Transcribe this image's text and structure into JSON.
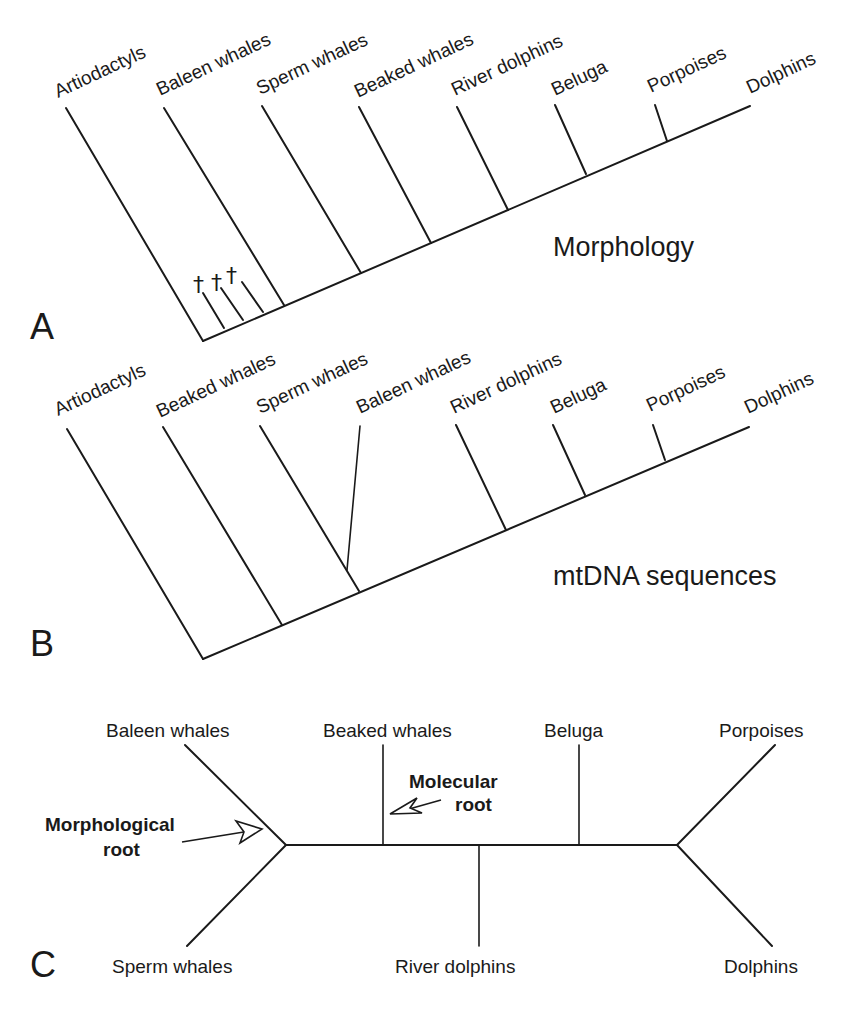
{
  "figure": {
    "panel_a": {
      "letter": "A",
      "title": "Morphology",
      "taxa": [
        "Artiodactyls",
        "Baleen whales",
        "Sperm whales",
        "Beaked whales",
        "River dolphins",
        "Beluga",
        "Porpoises",
        "Dolphins"
      ],
      "fossil_marks": [
        "†",
        "†",
        "†"
      ]
    },
    "panel_b": {
      "letter": "B",
      "title": "mtDNA sequences",
      "taxa": [
        "Artiodactyls",
        "Beaked whales",
        "Sperm whales",
        "Baleen whales",
        "River dolphins",
        "Beluga",
        "Porpoises",
        "Dolphins"
      ]
    },
    "panel_c": {
      "letter": "C",
      "taxa": {
        "baleen": "Baleen whales",
        "sperm": "Sperm whales",
        "beaked": "Beaked whales",
        "river": "River dolphins",
        "beluga": "Beluga",
        "porpoises": "Porpoises",
        "dolphins": "Dolphins"
      },
      "morphological_root": [
        "Morphological",
        "root"
      ],
      "molecular_root": [
        "Molecular",
        "root"
      ]
    }
  }
}
